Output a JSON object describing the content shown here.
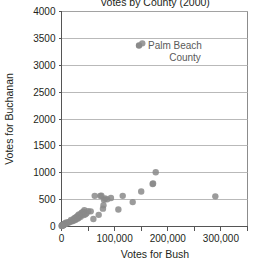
{
  "chart_data": {
    "type": "scatter",
    "title": "Votes by County (2000)",
    "xlabel": "Votes for Bush",
    "ylabel": "Votes for Buchanan",
    "xlim": [
      0,
      350000
    ],
    "ylim": [
      0,
      4000
    ],
    "xticks": [
      0,
      50000,
      100000,
      150000,
      200000,
      250000,
      300000,
      350000
    ],
    "xticklabels": [
      "0",
      "",
      "100,000",
      "",
      "200,000",
      "",
      "300,000",
      ""
    ],
    "yticks": [
      0,
      500,
      1000,
      1500,
      2000,
      2500,
      3000,
      3500,
      4000
    ],
    "yticklabels": [
      "0",
      "500",
      "1000",
      "1500",
      "2000",
      "2500",
      "3000",
      "3500",
      "4000"
    ],
    "grid": "horizontal",
    "legend": "none",
    "marker_color": "#8a8a8a",
    "marker_size": 4,
    "annotations": [
      {
        "text_line1": "Palm Beach",
        "text_line2": "County",
        "x": 152000,
        "y": 3400
      }
    ],
    "points": [
      {
        "x": 152000,
        "y": 3407
      },
      {
        "x": 289456,
        "y": 561
      },
      {
        "x": 177323,
        "y": 1010
      },
      {
        "x": 172331,
        "y": 800
      },
      {
        "x": 171500,
        "y": 790
      },
      {
        "x": 150000,
        "y": 650
      },
      {
        "x": 134000,
        "y": 454
      },
      {
        "x": 115185,
        "y": 570
      },
      {
        "x": 107000,
        "y": 316
      },
      {
        "x": 93000,
        "y": 530
      },
      {
        "x": 86000,
        "y": 505
      },
      {
        "x": 82000,
        "y": 520
      },
      {
        "x": 80000,
        "y": 497
      },
      {
        "x": 79000,
        "y": 396
      },
      {
        "x": 78000,
        "y": 332
      },
      {
        "x": 75000,
        "y": 572
      },
      {
        "x": 73000,
        "y": 570
      },
      {
        "x": 70000,
        "y": 217
      },
      {
        "x": 62500,
        "y": 570
      },
      {
        "x": 60000,
        "y": 140
      },
      {
        "x": 55000,
        "y": 282
      },
      {
        "x": 50000,
        "y": 286
      },
      {
        "x": 47000,
        "y": 248
      },
      {
        "x": 45000,
        "y": 228
      },
      {
        "x": 43000,
        "y": 305
      },
      {
        "x": 41000,
        "y": 270
      },
      {
        "x": 40000,
        "y": 229
      },
      {
        "x": 38000,
        "y": 250
      },
      {
        "x": 36000,
        "y": 182
      },
      {
        "x": 34000,
        "y": 195
      },
      {
        "x": 32000,
        "y": 160
      },
      {
        "x": 30000,
        "y": 145
      },
      {
        "x": 28000,
        "y": 178
      },
      {
        "x": 26000,
        "y": 120
      },
      {
        "x": 24000,
        "y": 132
      },
      {
        "x": 22000,
        "y": 108
      },
      {
        "x": 20000,
        "y": 97
      },
      {
        "x": 18000,
        "y": 122
      },
      {
        "x": 16000,
        "y": 88
      },
      {
        "x": 14000,
        "y": 75
      },
      {
        "x": 12000,
        "y": 80
      },
      {
        "x": 10000,
        "y": 62
      },
      {
        "x": 9000,
        "y": 55
      },
      {
        "x": 8000,
        "y": 70
      },
      {
        "x": 7000,
        "y": 46
      },
      {
        "x": 6000,
        "y": 52
      },
      {
        "x": 5000,
        "y": 38
      },
      {
        "x": 4500,
        "y": 44
      },
      {
        "x": 4000,
        "y": 30
      },
      {
        "x": 3500,
        "y": 35
      },
      {
        "x": 3000,
        "y": 22
      },
      {
        "x": 2500,
        "y": 28
      },
      {
        "x": 2000,
        "y": 18
      },
      {
        "x": 1500,
        "y": 24
      },
      {
        "x": 1200,
        "y": 14
      },
      {
        "x": 900,
        "y": 20
      },
      {
        "x": 600,
        "y": 10
      },
      {
        "x": 400,
        "y": 16
      },
      {
        "x": 35000,
        "y": 210
      },
      {
        "x": 37000,
        "y": 240
      },
      {
        "x": 39000,
        "y": 262
      },
      {
        "x": 42000,
        "y": 215
      },
      {
        "x": 33000,
        "y": 225
      },
      {
        "x": 31000,
        "y": 205
      },
      {
        "x": 29000,
        "y": 168
      },
      {
        "x": 27000,
        "y": 150
      },
      {
        "x": 25000,
        "y": 160
      },
      {
        "x": 23000,
        "y": 140
      }
    ]
  }
}
